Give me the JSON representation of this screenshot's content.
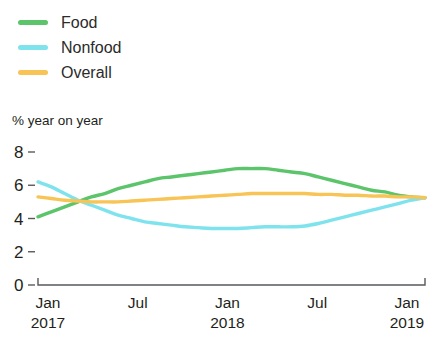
{
  "legend": {
    "items": [
      {
        "label": "Food",
        "color": "#5cc46a",
        "swatch_name": "legend-swatch-food"
      },
      {
        "label": "Nonfood",
        "color": "#7fe3ee",
        "swatch_name": "legend-swatch-nonfood"
      },
      {
        "label": "Overall",
        "color": "#f7c455",
        "swatch_name": "legend-swatch-overall"
      }
    ]
  },
  "axis_caption": "% year on year",
  "chart_data": {
    "type": "line",
    "title": "",
    "subtitle": "",
    "xlabel": "",
    "ylabel": "% year on year",
    "ylim": [
      0,
      8
    ],
    "yticks": [
      0,
      2,
      4,
      6,
      8
    ],
    "ytick_labels": [
      "0",
      "2",
      "4",
      "6",
      "8"
    ],
    "grid": false,
    "legend_position": "top-left",
    "xtick_labels": [
      {
        "month": "Jan",
        "year": "2017"
      },
      {
        "month": "Jul",
        "year": ""
      },
      {
        "month": "Jan",
        "year": "2018"
      },
      {
        "month": "Jul",
        "year": ""
      },
      {
        "month": "Jan",
        "year": "2019"
      }
    ],
    "x": [
      "2017-01",
      "2017-02",
      "2017-03",
      "2017-04",
      "2017-05",
      "2017-06",
      "2017-07",
      "2017-08",
      "2017-09",
      "2017-10",
      "2017-11",
      "2017-12",
      "2018-01",
      "2018-02",
      "2018-03",
      "2018-04",
      "2018-05",
      "2018-06",
      "2018-07",
      "2018-08",
      "2018-09",
      "2018-10",
      "2018-11",
      "2018-12",
      "2019-01",
      "2019-02",
      "2019-03",
      "2019-04",
      "2019-05",
      "2019-06"
    ],
    "series": [
      {
        "name": "Food",
        "color": "#5cc46a",
        "values": [
          4.1,
          4.4,
          4.7,
          5.0,
          5.3,
          5.5,
          5.8,
          6.0,
          6.2,
          6.4,
          6.5,
          6.6,
          6.7,
          6.8,
          6.9,
          7.0,
          7.0,
          7.0,
          6.9,
          6.8,
          6.7,
          6.5,
          6.3,
          6.1,
          5.9,
          5.7,
          5.6,
          5.4,
          5.3,
          5.25
        ]
      },
      {
        "name": "Nonfood",
        "color": "#7fe3ee",
        "values": [
          6.2,
          5.9,
          5.5,
          5.1,
          4.8,
          4.5,
          4.2,
          4.0,
          3.8,
          3.7,
          3.6,
          3.5,
          3.45,
          3.4,
          3.4,
          3.4,
          3.45,
          3.5,
          3.5,
          3.5,
          3.55,
          3.7,
          3.9,
          4.1,
          4.3,
          4.5,
          4.7,
          4.9,
          5.1,
          5.25
        ]
      },
      {
        "name": "Overall",
        "color": "#f7c455",
        "values": [
          5.3,
          5.2,
          5.1,
          5.05,
          5.0,
          5.0,
          5.0,
          5.05,
          5.1,
          5.15,
          5.2,
          5.25,
          5.3,
          5.35,
          5.4,
          5.45,
          5.5,
          5.5,
          5.5,
          5.5,
          5.5,
          5.45,
          5.45,
          5.4,
          5.4,
          5.35,
          5.35,
          5.3,
          5.3,
          5.25
        ]
      }
    ]
  }
}
